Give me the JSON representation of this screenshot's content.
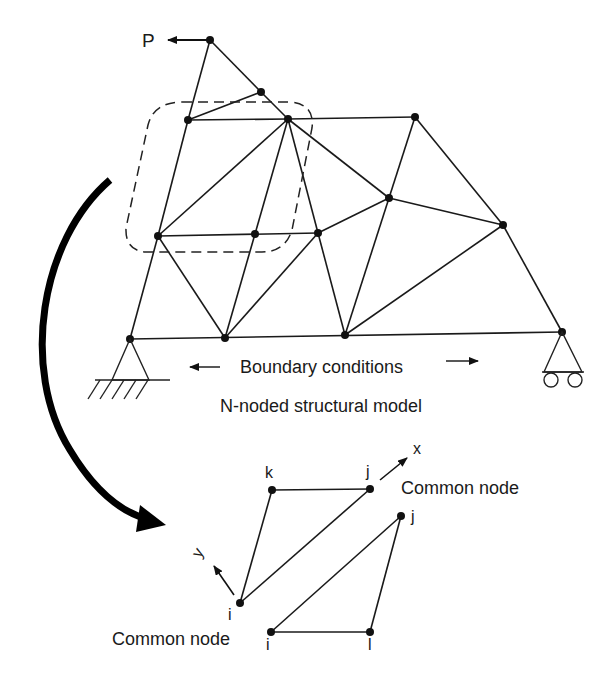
{
  "diagram": {
    "load_label": "P",
    "boundary_label": "Boundary conditions",
    "model_caption": "N-noded structural model",
    "x_axis_label": "x",
    "y_axis_label": "y",
    "common_node_right": "Common node",
    "common_node_left": "Common node",
    "element1": {
      "node_k": "k",
      "node_j": "j",
      "node_i": "i"
    },
    "element2": {
      "node_j": "j",
      "node_i": "i",
      "node_l": "l"
    }
  }
}
